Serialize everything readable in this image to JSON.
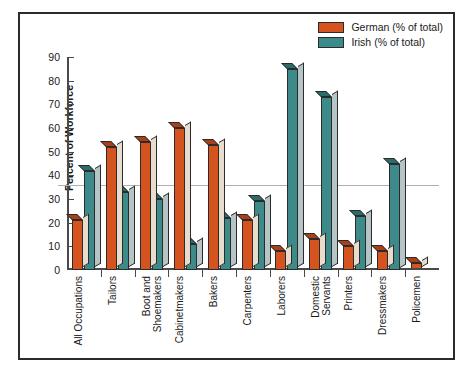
{
  "chart_data": {
    "type": "bar",
    "title": "",
    "xlabel": "",
    "ylabel": "Percent of Workforce",
    "ylim": [
      0,
      90
    ],
    "ytick_step": 10,
    "yticks": [
      0,
      10,
      20,
      30,
      40,
      50,
      60,
      70,
      80,
      90
    ],
    "grid": true,
    "gridline_value": 36,
    "legend_position": "top-right",
    "categories": [
      "All Occupations",
      "Tailors",
      "Boot and\nShoemakers",
      "Cabinetmakers",
      "Bakers",
      "Carpenters",
      "Laborers",
      "Domestic\nServants",
      "Printers",
      "Dressmakers",
      "Policemen"
    ],
    "series": [
      {
        "name": "German (% of total)",
        "color": "#D4531E",
        "side_color": "#E8DCCC",
        "top_color": "#A8401A",
        "values": [
          21,
          52,
          54,
          60,
          53,
          21,
          8,
          13,
          10,
          8,
          3
        ]
      },
      {
        "name": "Irish (% of total)",
        "color": "#3D8A8A",
        "side_color": "#B6C4C6",
        "top_color": "#2E6B6B",
        "values": [
          42,
          33,
          30,
          11,
          22,
          29,
          85,
          73,
          23,
          45,
          24
        ]
      }
    ]
  },
  "legend": {
    "entries": [
      {
        "label": "German (% of total)",
        "color": "#D4531E"
      },
      {
        "label": "Irish (% of total)",
        "color": "#3D8A8A"
      }
    ]
  },
  "axes": {
    "y_title": "Percent of Workforce"
  }
}
